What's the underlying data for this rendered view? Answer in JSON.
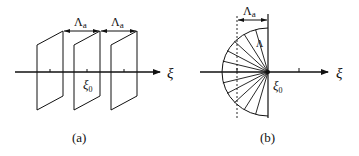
{
  "figure": {
    "panels": [
      {
        "id": "a",
        "caption": "(a)",
        "axis_label": "ξ",
        "origin_label": "ξ",
        "origin_subscript": "0",
        "spacing_labels": [
          {
            "main": "Λ",
            "sub": "a"
          },
          {
            "main": "Λ",
            "sub": "a"
          }
        ],
        "description": "Three parallel planes perpendicular to the ξ axis, spaced Λa apart"
      },
      {
        "id": "b",
        "caption": "(b)",
        "axis_label": "ξ",
        "origin_label": "ξ",
        "origin_subscript": "0",
        "spacing_label": {
          "main": "Λ",
          "sub": "a"
        },
        "ray_label": "Λ",
        "description": "Semicircular fan of rays from ξ0 with dashed line at distance Λa"
      }
    ],
    "colors": {
      "line": "#111111",
      "background": "#ffffff"
    }
  }
}
